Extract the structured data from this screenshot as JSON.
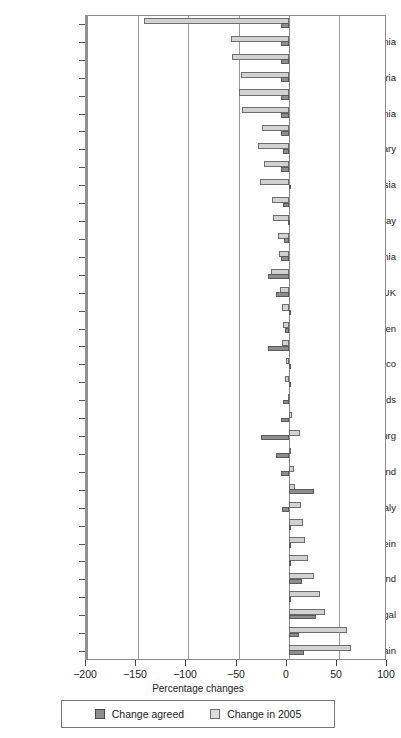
{
  "chart_data": {
    "type": "bar",
    "orientation": "horizontal",
    "title": "",
    "xlabel": "Percentage changes",
    "ylabel": "",
    "xlim": [
      -200,
      100
    ],
    "xticks": [
      -200,
      -150,
      -100,
      -50,
      0,
      50,
      100
    ],
    "xticklabels": [
      "−200",
      "−150",
      "−100",
      "−50",
      "0",
      "50",
      "100"
    ],
    "grid": true,
    "grid_axis": "x",
    "legend_position": "bottom",
    "categories": [
      "Latvia",
      "Lithuania",
      "Estonia",
      "Bulgaria",
      "Ukraine",
      "Romania",
      "Slovakia",
      "Hungary",
      "Czech Republic",
      "Russia",
      "Poland",
      "Norway",
      "Croatia",
      "Slovenia",
      "Germany",
      "UK",
      "Finland",
      "Sweden",
      "Denmark",
      "Monaco",
      "France",
      "Netherlands",
      "Belgium",
      "Luxembourg",
      "Austria",
      "Switzerland",
      "Greece",
      "Italy",
      "Malta",
      "Liechtenstein",
      "Cyprus",
      "Ireland",
      "Turkey",
      "Portugal",
      "Iceland",
      "Spain"
    ],
    "labelled_categories": [
      "Lithuania",
      "Bulgaria",
      "Romania",
      "Hungary",
      "Russia",
      "Norway",
      "Slovenia",
      "UK",
      "Sweden",
      "Monaco",
      "Netherlands",
      "Luxembourg",
      "Switzerland",
      "Italy",
      "Liechtenstein",
      "Ireland",
      "Portugal",
      "Spain"
    ],
    "series": [
      {
        "name": "Change agreed",
        "color": "#8d8d8d",
        "values": [
          -8,
          -8,
          -8,
          -8,
          -8,
          -8,
          -8,
          -6,
          -8,
          0,
          -6,
          -1,
          -5,
          -8,
          -21,
          -12.5,
          0,
          -4,
          -21,
          0,
          0,
          -6,
          -7.5,
          -28,
          -13,
          -8,
          25,
          -6.5,
          0,
          0,
          0,
          13,
          0,
          27,
          10,
          15
        ]
      },
      {
        "name": "Change in 2005",
        "color": "#d2d2d2",
        "values": [
          -144,
          -57,
          -56,
          -48,
          -50,
          -47,
          -27,
          -31,
          -25,
          -29,
          -17,
          -16,
          -11,
          -10,
          -18,
          -9,
          -7,
          -6,
          -7,
          -3,
          -4,
          -1,
          3,
          11,
          2,
          5,
          6,
          12,
          14,
          16,
          19,
          25,
          31,
          36,
          58,
          62
        ]
      }
    ]
  },
  "legend": {
    "items": [
      {
        "label": "Change agreed",
        "swatch": "dark-square-swatch"
      },
      {
        "label": "Change in 2005",
        "swatch": "light-square-swatch"
      }
    ]
  }
}
